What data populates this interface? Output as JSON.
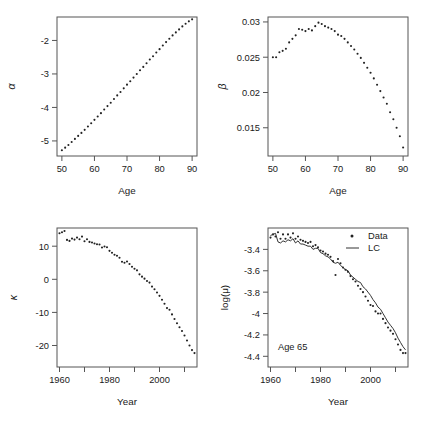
{
  "figure": {
    "background": "#ffffff",
    "point_color": "#222222",
    "line_color": "#333333",
    "axis_color": "#555555",
    "layout": "2x2 grid of scatter panels"
  },
  "panels": [
    {
      "id": "alpha-panel",
      "position": "top-left",
      "ylabel": "α",
      "xlabel": "Age",
      "xticks": [
        "50",
        "60",
        "70",
        "80",
        "90"
      ],
      "yticks": [
        "-2",
        "-3",
        "-4",
        "-5"
      ]
    },
    {
      "id": "beta-panel",
      "position": "top-right",
      "ylabel": "β",
      "xlabel": "Age",
      "xticks": [
        "50",
        "60",
        "70",
        "80",
        "90"
      ],
      "yticks": [
        "0.030",
        "0.025",
        "0.020",
        "0.015"
      ]
    },
    {
      "id": "kappa-panel",
      "position": "bottom-left",
      "ylabel": "κ",
      "xlabel": "Year",
      "xticks": [
        "1960",
        "1980",
        "2000"
      ],
      "yticks": [
        "10",
        "0",
        "-10",
        "-20"
      ]
    },
    {
      "id": "logmu-panel",
      "position": "bottom-right",
      "ylabel": "log(μ)",
      "xlabel": "Year",
      "xticks": [
        "1960",
        "1980",
        "2000"
      ],
      "yticks": [
        "-3.4",
        "-3.6",
        "-3.8",
        "-4.0",
        "-4.2",
        "-4.4"
      ],
      "annotation": "Age 65",
      "legend": [
        {
          "label": "Data",
          "marker": "point"
        },
        {
          "label": "LC",
          "marker": "line"
        }
      ]
    }
  ],
  "chart_data": [
    {
      "type": "scatter",
      "title": "",
      "xlabel": "Age",
      "ylabel": "α",
      "xlim": [
        48.5,
        91.5
      ],
      "ylim": [
        -5.45,
        -1.3
      ],
      "xticks": [
        50,
        60,
        70,
        80,
        90
      ],
      "yticks": [
        -2,
        -3,
        -4,
        -5
      ],
      "grid": false,
      "series": [
        {
          "name": "alpha",
          "x": [
            50,
            51,
            52,
            53,
            54,
            55,
            56,
            57,
            58,
            59,
            60,
            61,
            62,
            63,
            64,
            65,
            66,
            67,
            68,
            69,
            70,
            71,
            72,
            73,
            74,
            75,
            76,
            77,
            78,
            79,
            80,
            81,
            82,
            83,
            84,
            85,
            86,
            87,
            88,
            89,
            90
          ],
          "y": [
            -5.28,
            -5.2,
            -5.12,
            -5.03,
            -4.94,
            -4.85,
            -4.76,
            -4.67,
            -4.57,
            -4.47,
            -4.37,
            -4.27,
            -4.17,
            -4.06,
            -3.96,
            -3.86,
            -3.75,
            -3.64,
            -3.54,
            -3.43,
            -3.32,
            -3.22,
            -3.11,
            -3.0,
            -2.89,
            -2.79,
            -2.68,
            -2.57,
            -2.47,
            -2.36,
            -2.26,
            -2.15,
            -2.05,
            -1.95,
            -1.85,
            -1.76,
            -1.67,
            -1.58,
            -1.5,
            -1.43,
            -1.37
          ]
        }
      ]
    },
    {
      "type": "scatter",
      "title": "",
      "xlabel": "Age",
      "ylabel": "β",
      "xlim": [
        48.5,
        91.5
      ],
      "ylim": [
        0.011,
        0.0307
      ],
      "xticks": [
        50,
        60,
        70,
        80,
        90
      ],
      "yticks": [
        0.015,
        0.02,
        0.025,
        0.03
      ],
      "grid": false,
      "series": [
        {
          "name": "beta",
          "x": [
            50,
            51,
            52,
            53,
            54,
            55,
            56,
            57,
            58,
            59,
            60,
            61,
            62,
            63,
            64,
            65,
            66,
            67,
            68,
            69,
            70,
            71,
            72,
            73,
            74,
            75,
            76,
            77,
            78,
            79,
            80,
            81,
            82,
            83,
            84,
            85,
            86,
            87,
            88,
            89,
            90
          ],
          "y": [
            0.025,
            0.025,
            0.0257,
            0.0259,
            0.0262,
            0.0271,
            0.0276,
            0.0281,
            0.029,
            0.0289,
            0.0287,
            0.029,
            0.0288,
            0.0294,
            0.0299,
            0.0297,
            0.0294,
            0.0292,
            0.029,
            0.0287,
            0.0282,
            0.028,
            0.0276,
            0.0271,
            0.0266,
            0.0261,
            0.0255,
            0.0249,
            0.0242,
            0.0235,
            0.0228,
            0.022,
            0.0211,
            0.0202,
            0.0193,
            0.0184,
            0.0172,
            0.0162,
            0.015,
            0.0138,
            0.0122
          ]
        }
      ]
    },
    {
      "type": "scatter",
      "title": "",
      "xlabel": "Year",
      "ylabel": "κ",
      "xlim": [
        1959.0,
        2015.0
      ],
      "ylim": [
        -26.5,
        15.5
      ],
      "xticks": [
        1960,
        1970,
        1980,
        1990,
        2000,
        2010
      ],
      "xticklabels": [
        "1960",
        "",
        "1980",
        "",
        "2000",
        ""
      ],
      "yticks": [
        -20,
        -10,
        0,
        10
      ],
      "grid": false,
      "series": [
        {
          "name": "kappa",
          "x": [
            1960,
            1961,
            1962,
            1963,
            1964,
            1965,
            1966,
            1967,
            1968,
            1969,
            1970,
            1971,
            1972,
            1973,
            1974,
            1975,
            1976,
            1977,
            1978,
            1979,
            1980,
            1981,
            1982,
            1983,
            1984,
            1985,
            1986,
            1987,
            1988,
            1989,
            1990,
            1991,
            1992,
            1993,
            1994,
            1995,
            1996,
            1997,
            1998,
            1999,
            2000,
            2001,
            2002,
            2003,
            2004,
            2005,
            2006,
            2007,
            2008,
            2009,
            2010,
            2011,
            2012,
            2013,
            2014
          ],
          "y": [
            13.9,
            14.2,
            14.6,
            11.9,
            11.6,
            12.3,
            12.0,
            12.6,
            12.1,
            12.9,
            11.5,
            12.1,
            11.3,
            11.1,
            10.8,
            10.6,
            10.5,
            9.6,
            9.9,
            9.7,
            8.6,
            8.0,
            7.4,
            7.1,
            6.5,
            5.3,
            5.0,
            5.4,
            4.6,
            3.8,
            3.2,
            2.7,
            1.5,
            0.8,
            0.2,
            -0.5,
            -1.0,
            -2.2,
            -3.0,
            -4.0,
            -5.0,
            -6.2,
            -7.4,
            -8.7,
            -9.2,
            -10.6,
            -12.0,
            -13.3,
            -14.5,
            -15.6,
            -17.0,
            -18.5,
            -20.0,
            -21.4,
            -22.3
          ]
        }
      ]
    },
    {
      "type": "scatter",
      "title": "",
      "xlabel": "Year",
      "ylabel": "log(μ)",
      "xlim": [
        1959.0,
        2015.0
      ],
      "ylim": [
        -4.5,
        -3.2
      ],
      "xticks": [
        1960,
        1970,
        1980,
        1990,
        2000,
        2010
      ],
      "xticklabels": [
        "1960",
        "",
        "1980",
        "",
        "2000",
        ""
      ],
      "yticks": [
        -3.4,
        -3.6,
        -3.8,
        -4.0,
        -4.2,
        -4.4
      ],
      "annotation": "Age 65",
      "grid": false,
      "legend": {
        "position": "top-right",
        "entries": [
          "Data",
          "LC"
        ]
      },
      "series": [
        {
          "name": "Data",
          "marker": "point",
          "x": [
            1960,
            1961,
            1962,
            1963,
            1964,
            1965,
            1966,
            1967,
            1968,
            1969,
            1970,
            1971,
            1972,
            1973,
            1974,
            1975,
            1976,
            1977,
            1978,
            1979,
            1980,
            1981,
            1982,
            1983,
            1984,
            1985,
            1986,
            1987,
            1988,
            1989,
            1990,
            1991,
            1992,
            1993,
            1994,
            1995,
            1996,
            1997,
            1998,
            1999,
            2000,
            2001,
            2002,
            2003,
            2004,
            2005,
            2006,
            2007,
            2008,
            2009,
            2010,
            2011,
            2012,
            2013,
            2014
          ],
          "y": [
            -3.29,
            -3.26,
            -3.28,
            -3.24,
            -3.3,
            -3.26,
            -3.3,
            -3.26,
            -3.29,
            -3.25,
            -3.3,
            -3.28,
            -3.31,
            -3.32,
            -3.33,
            -3.34,
            -3.33,
            -3.37,
            -3.36,
            -3.38,
            -3.41,
            -3.42,
            -3.44,
            -3.45,
            -3.47,
            -3.51,
            -3.64,
            -3.49,
            -3.53,
            -3.57,
            -3.59,
            -3.61,
            -3.65,
            -3.68,
            -3.7,
            -3.74,
            -3.77,
            -3.8,
            -3.84,
            -3.88,
            -3.92,
            -3.93,
            -3.98,
            -4.0,
            -4.0,
            -4.05,
            -4.09,
            -4.13,
            -4.16,
            -4.19,
            -4.24,
            -4.29,
            -4.34,
            -4.37,
            -4.37
          ]
        },
        {
          "name": "LC",
          "marker": "line",
          "x": [
            1960,
            1961,
            1962,
            1963,
            1964,
            1965,
            1966,
            1967,
            1968,
            1969,
            1970,
            1971,
            1972,
            1973,
            1974,
            1975,
            1976,
            1977,
            1978,
            1979,
            1980,
            1981,
            1982,
            1983,
            1984,
            1985,
            1986,
            1987,
            1988,
            1989,
            1990,
            1991,
            1992,
            1993,
            1994,
            1995,
            1996,
            1997,
            1998,
            1999,
            2000,
            2001,
            2002,
            2003,
            2004,
            2005,
            2006,
            2007,
            2008,
            2009,
            2010,
            2011,
            2012,
            2013,
            2014
          ],
          "y": [
            -3.27,
            -3.26,
            -3.25,
            -3.33,
            -3.34,
            -3.32,
            -3.33,
            -3.31,
            -3.32,
            -3.3,
            -3.34,
            -3.32,
            -3.35,
            -3.35,
            -3.36,
            -3.37,
            -3.37,
            -3.4,
            -3.39,
            -3.39,
            -3.43,
            -3.44,
            -3.46,
            -3.47,
            -3.49,
            -3.52,
            -3.53,
            -3.52,
            -3.55,
            -3.57,
            -3.59,
            -3.6,
            -3.64,
            -3.66,
            -3.68,
            -3.7,
            -3.71,
            -3.75,
            -3.77,
            -3.8,
            -3.83,
            -3.87,
            -3.9,
            -3.94,
            -3.96,
            -4.0,
            -4.04,
            -4.08,
            -4.11,
            -4.14,
            -4.18,
            -4.23,
            -4.27,
            -4.31,
            -4.34
          ]
        }
      ]
    }
  ]
}
